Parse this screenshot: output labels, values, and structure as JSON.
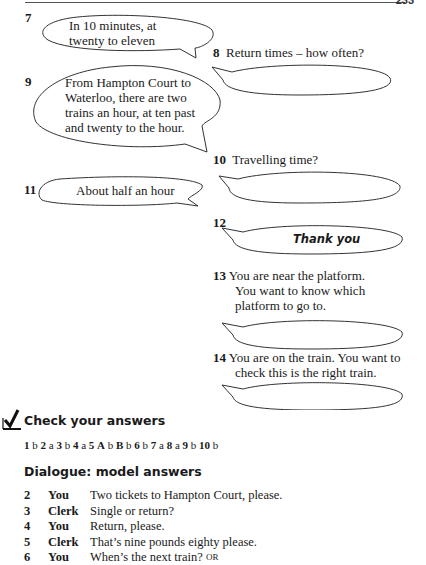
{
  "page": {
    "page_number": "233"
  },
  "exercise": {
    "items": [
      {
        "num": "7",
        "bubble_text": [
          "In 10 minutes, at",
          "twenty to eleven"
        ]
      },
      {
        "num": "8",
        "prompt": "Return times – how often?",
        "bubble_text": []
      },
      {
        "num": "9",
        "bubble_text": [
          "From Hampton Court to",
          "Waterloo, there are two",
          "trains an hour, at ten past",
          "and twenty to the hour."
        ]
      },
      {
        "num": "10",
        "prompt": "Travelling time?",
        "bubble_text": []
      },
      {
        "num": "11",
        "bubble_text": [
          "About half an hour"
        ]
      },
      {
        "num": "12",
        "bubble_text": [
          "Thank you"
        ]
      },
      {
        "num": "13",
        "prompt_lines": [
          "You are near the platform.",
          "You want to know which",
          "platform to go to."
        ],
        "bubble_text": []
      },
      {
        "num": "14",
        "prompt_lines": [
          "You are on the train. You want to",
          "check this is the right train."
        ],
        "bubble_text": []
      }
    ]
  },
  "check": {
    "icon": "checkmark-box-icon",
    "title": "Check your answers",
    "answers": [
      {
        "q": "1",
        "a": "b"
      },
      {
        "q": "2",
        "a": "a"
      },
      {
        "q": "3",
        "a": "b"
      },
      {
        "q": "4",
        "a": "a"
      },
      {
        "q": "5",
        "a": ""
      },
      {
        "q": "A",
        "a": "b"
      },
      {
        "q": "B",
        "a": "b"
      },
      {
        "q": "6",
        "a": "b"
      },
      {
        "q": "7",
        "a": "a"
      },
      {
        "q": "8",
        "a": "a"
      },
      {
        "q": "9",
        "a": "b"
      },
      {
        "q": "10",
        "a": "b"
      }
    ]
  },
  "dialogue": {
    "title": "Dialogue: model answers",
    "lines": [
      {
        "n": "2",
        "speaker": "You",
        "text": "Two tickets to Hampton Court, please."
      },
      {
        "n": "3",
        "speaker": "Clerk",
        "text": "Single or return?"
      },
      {
        "n": "4",
        "speaker": "You",
        "text": "Return, please."
      },
      {
        "n": "5",
        "speaker": "Clerk",
        "text": "That’s nine pounds eighty please."
      },
      {
        "n": "6",
        "speaker": "You",
        "text": "When’s the next train?",
        "suffix": "OR"
      }
    ]
  }
}
